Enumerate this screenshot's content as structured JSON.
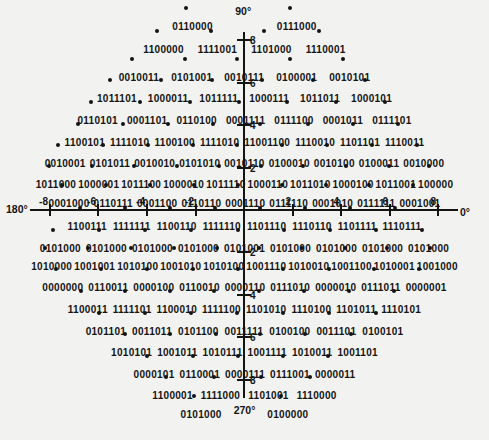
{
  "chart_data": {
    "type": "scatter",
    "title": "",
    "xlabel": "",
    "ylabel": "",
    "x_range": [
      -9,
      9
    ],
    "y_range": [
      -9,
      9
    ],
    "grid": false,
    "angle_labels": {
      "top": "90°",
      "bottom": "270°",
      "left": "180°",
      "right": "0°"
    },
    "x_tick_labels": [
      "-8",
      "-6",
      "-4",
      "-2",
      "2",
      "4",
      "6",
      "8"
    ],
    "y_tick_labels": [
      "8",
      "6",
      "4",
      "2",
      "2",
      "4",
      "6",
      "8"
    ],
    "rows": [
      {
        "q": 9,
        "labels": [
          "0110000",
          "0111000"
        ]
      },
      {
        "q": 8,
        "labels": [
          "1100000",
          "1111001",
          "1101000",
          "1110001"
        ]
      },
      {
        "q": 7,
        "labels": [
          "0010011",
          "0101001",
          "0010111",
          "0100001",
          "0010101"
        ]
      },
      {
        "q": 6,
        "labels": [
          "1011101",
          "1000011",
          "1011111",
          "1000111",
          "1011011",
          "1000101"
        ]
      },
      {
        "q": 5,
        "labels": [
          "0110101",
          "0001101",
          "0110100",
          "0001111",
          "0111100",
          "0001011",
          "0111101"
        ]
      },
      {
        "q": 4,
        "labels": [
          "1100101",
          "1111010",
          "1100100",
          "1111010",
          "11001100",
          "1110010",
          "1101101",
          "1110011"
        ]
      },
      {
        "q": 3,
        "labels": [
          "0010001",
          "0101011",
          "0010010",
          "0101010",
          "0010110",
          "0100010",
          "0010100",
          "0100011",
          "0010000"
        ]
      },
      {
        "q": 2,
        "labels": [
          "1011000",
          "1000001",
          "1011100",
          "1000010",
          "1011110",
          "1000110",
          "1011010",
          "1000100",
          "1011001",
          "100000"
        ]
      },
      {
        "q": 1,
        "labels": [
          "0001000",
          "0110111",
          "0001100",
          "0110110",
          "0001110",
          "0111110",
          "0001010",
          "0111111",
          "0001001"
        ]
      },
      {
        "q": 0,
        "labels": [
          "1100111",
          "1111111",
          "1100110",
          "1111110",
          "1101110",
          "1110110",
          "1101111",
          "1110111"
        ]
      },
      {
        "q": -1,
        "labels": [
          "0101000",
          "0101000",
          "0101000",
          "0101000",
          "0101001",
          "0101000",
          "0101000",
          "0101000",
          "0101000"
        ]
      },
      {
        "q": -2,
        "labels": [
          "1010000",
          "1001001",
          "1010100",
          "1001010",
          "1010100",
          "1001110",
          "1010010",
          "1001100",
          "1010001",
          "1001000"
        ]
      },
      {
        "q": -3,
        "labels": [
          "0000000",
          "0110011",
          "0000100",
          "0110010",
          "0000110",
          "0111010",
          "0000010",
          "0111011",
          "0000001"
        ]
      },
      {
        "q": -4,
        "labels": [
          "1100011",
          "1111101",
          "1100010",
          "1111100",
          "1101010",
          "1110100",
          "1101011",
          "1110101"
        ]
      },
      {
        "q": -5,
        "labels": [
          "0101101",
          "0011011",
          "0101100",
          "0011111",
          "0100100",
          "0011101",
          "0100101"
        ]
      },
      {
        "q": -6,
        "labels": [
          "1010101",
          "1001011",
          "1010111",
          "1001111",
          "1010011",
          "1001101"
        ]
      },
      {
        "q": -7,
        "labels": [
          "0000101",
          "0110001",
          "0000111",
          "0111001",
          "0000011"
        ]
      },
      {
        "q": -8,
        "labels": [
          "1100001",
          "1111000",
          "1101001",
          "1110000"
        ]
      },
      {
        "q": -9,
        "labels": [
          "0101000",
          "0100000"
        ]
      }
    ]
  },
  "layout": {
    "row_tops": [
      16,
      39,
      67,
      88,
      110,
      132,
      153,
      174,
      193,
      216,
      238,
      256,
      277,
      299,
      321,
      342,
      364,
      385,
      404
    ],
    "row_gaps": [
      64,
      14,
      12,
      11,
      9,
      5,
      4,
      2,
      4,
      6,
      5,
      2,
      5,
      5,
      6,
      5,
      5,
      8,
      12
    ],
    "x_tick_x": [
      50,
      98,
      147,
      196,
      293,
      341,
      390,
      438
    ],
    "y_tick_y": [
      40,
      83,
      125,
      168,
      252,
      295,
      337,
      380
    ]
  }
}
